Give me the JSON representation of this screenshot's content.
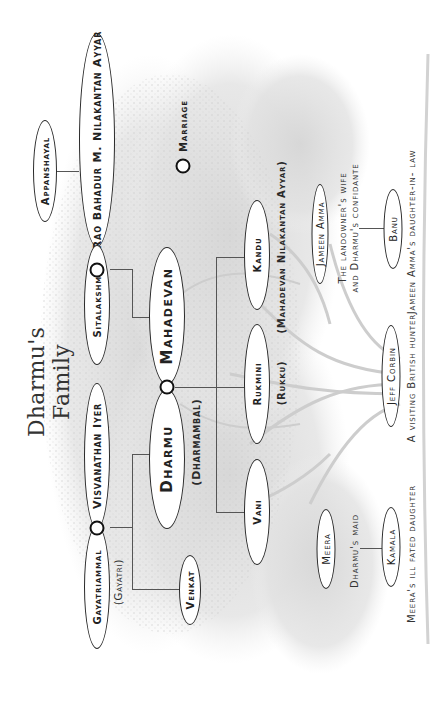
{
  "title": "Dharmu's Family",
  "legend": {
    "symbol": "marriage-ring",
    "label": "Marriage"
  },
  "colors": {
    "ink": "#1a1a1a",
    "line": "#555555",
    "tree_background": "#d9d9d9",
    "paper": "#ffffff"
  },
  "generations": {
    "elders": [
      {
        "id": "appanshayal",
        "name": "Appanshayal"
      },
      {
        "id": "rao-bahadur",
        "name": "Rao Bahadur M. Nilakantan Ayyar"
      },
      {
        "id": "sitalakshmi",
        "name": "Sitalakshmi"
      },
      {
        "id": "visvanathan",
        "name": "Visvanathan Iyer"
      },
      {
        "id": "gayatriammal",
        "name": "Gayatriammal",
        "alias": "(Gayatri)"
      }
    ],
    "parents": [
      {
        "id": "mahadevan",
        "name": "Mahadevan"
      },
      {
        "id": "dharmu",
        "name": "Dharmu",
        "alias": "(Dharmambal)"
      },
      {
        "id": "venkat",
        "name": "Venkat"
      }
    ],
    "children": [
      {
        "id": "vani",
        "name": "Vani"
      },
      {
        "id": "rukmini",
        "name": "Rukmini",
        "alias": "(Rukku)"
      },
      {
        "id": "kandu",
        "name": "Kandu",
        "alias": "(Mahadevan Nilakantan Ayyar)"
      }
    ]
  },
  "marriages": [
    [
      "rao-bahadur",
      "sitalakshmi"
    ],
    [
      "visvanathan",
      "gayatriammal"
    ],
    [
      "mahadevan",
      "dharmu"
    ]
  ],
  "others": {
    "jameen_amma": {
      "name": "Jameen Amma",
      "caption_lines": [
        "The landowner's wife",
        "and Dharmu's confidante"
      ]
    },
    "banu": {
      "name": "Banu",
      "caption": "Jameen Amma's daughter-in- law"
    },
    "jeff_corbin": {
      "name": "Jeff Corbin",
      "caption": "A visiting British hunter"
    },
    "meera": {
      "name": "Meera",
      "caption": "Dharmu's maid"
    },
    "kamala": {
      "name": "Kamala",
      "caption": "Meera's ill fated daughter"
    }
  }
}
